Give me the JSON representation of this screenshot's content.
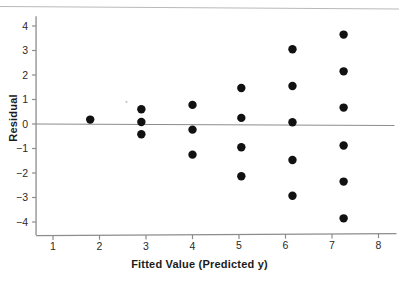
{
  "chart_data": {
    "type": "scatter",
    "title": "",
    "xlabel": "Fitted Value (Predicted y)",
    "ylabel": "Residual",
    "xlim": [
      0.7,
      8.3
    ],
    "ylim": [
      -4.45,
      4.4
    ],
    "xticks": [
      1,
      2,
      3,
      4,
      5,
      6,
      7,
      8
    ],
    "xtick_labels": [
      "1",
      "2",
      "3",
      "4",
      "5",
      "6",
      "7",
      "8"
    ],
    "yticks": [
      -4,
      -3,
      -2,
      -1,
      0,
      1,
      2,
      3,
      4
    ],
    "ytick_labels": [
      "−4",
      "−3",
      "−2",
      "−1",
      "0",
      "1",
      "2",
      "3",
      "4"
    ],
    "grid": false,
    "legend": null,
    "reference_line": {
      "orientation": "horizontal",
      "y": 0,
      "color": "#8c8c8c"
    },
    "marker": {
      "shape": "circle",
      "color": "#111111",
      "size": 4.2
    },
    "x": [
      1.8,
      2.9,
      2.9,
      2.9,
      4.0,
      4.0,
      4.0,
      5.05,
      5.05,
      5.05,
      5.05,
      6.15,
      6.15,
      6.15,
      6.15,
      6.15,
      7.25,
      7.25,
      7.25,
      7.25,
      7.25,
      7.25
    ],
    "y": [
      0.18,
      0.6,
      0.08,
      -0.42,
      0.78,
      -0.23,
      -1.25,
      1.47,
      0.25,
      -0.95,
      -2.13,
      3.05,
      1.55,
      0.07,
      -1.47,
      -2.93,
      3.65,
      2.15,
      0.67,
      -0.88,
      -2.35,
      -3.85
    ],
    "points": [
      {
        "x": 1.8,
        "y": 0.18
      },
      {
        "x": 2.9,
        "y": 0.6
      },
      {
        "x": 2.9,
        "y": 0.08
      },
      {
        "x": 2.9,
        "y": -0.42
      },
      {
        "x": 4.0,
        "y": 0.78
      },
      {
        "x": 4.0,
        "y": -0.23
      },
      {
        "x": 4.0,
        "y": -1.25
      },
      {
        "x": 5.05,
        "y": 1.47
      },
      {
        "x": 5.05,
        "y": 0.25
      },
      {
        "x": 5.05,
        "y": -0.95
      },
      {
        "x": 5.05,
        "y": -2.13
      },
      {
        "x": 6.15,
        "y": 3.05
      },
      {
        "x": 6.15,
        "y": 1.55
      },
      {
        "x": 6.15,
        "y": 0.07
      },
      {
        "x": 6.15,
        "y": -1.47
      },
      {
        "x": 6.15,
        "y": -2.93
      },
      {
        "x": 7.25,
        "y": 3.65
      },
      {
        "x": 7.25,
        "y": 2.15
      },
      {
        "x": 7.25,
        "y": 0.67
      },
      {
        "x": 7.25,
        "y": -0.88
      },
      {
        "x": 7.25,
        "y": -2.35
      },
      {
        "x": 7.25,
        "y": -3.85
      }
    ],
    "artifacts": [
      {
        "name": "scan-smudge",
        "x": 2.58,
        "y": 0.9
      }
    ]
  },
  "colors": {
    "marker": "#111111",
    "axis": "#8c8c8c",
    "reference_line": "#8c8c8c",
    "text": "#1b1b1b",
    "background": "#ffffff"
  }
}
